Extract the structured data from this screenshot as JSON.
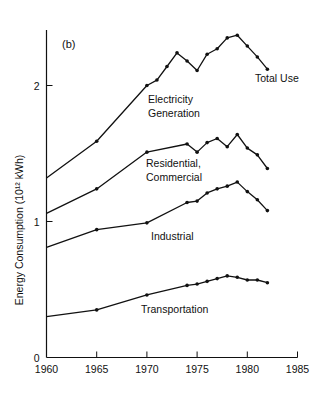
{
  "chart_data": {
    "type": "line",
    "panel_label": "(b)",
    "title": "",
    "xlabel": "",
    "ylabel": "Energy Consumption (10¹² kWh)",
    "xlim": [
      1960,
      1985
    ],
    "ylim": [
      0,
      2.4
    ],
    "x_ticks": [
      1960,
      1965,
      1970,
      1975,
      1980,
      1985
    ],
    "y_ticks": [
      0,
      1,
      2
    ],
    "grid": false,
    "legend": "inline labels",
    "series": [
      {
        "name": "Total Use",
        "label_lines": [
          "Total Use"
        ],
        "x": [
          1960,
          1965,
          1970,
          1971,
          1972,
          1973,
          1974,
          1975,
          1976,
          1977,
          1978,
          1979,
          1980,
          1981,
          1982
        ],
        "values": [
          1.32,
          1.59,
          2.0,
          2.04,
          2.14,
          2.24,
          2.18,
          2.11,
          2.23,
          2.27,
          2.35,
          2.37,
          2.29,
          2.21,
          2.12
        ]
      },
      {
        "name": "Residential, Commercial",
        "label_lines": [
          "Residential,",
          "Commercial"
        ],
        "x": [
          1960,
          1965,
          1970,
          1974,
          1975,
          1976,
          1977,
          1978,
          1979,
          1980,
          1981,
          1982
        ],
        "values": [
          1.06,
          1.24,
          1.51,
          1.57,
          1.51,
          1.58,
          1.61,
          1.55,
          1.64,
          1.54,
          1.49,
          1.39
        ]
      },
      {
        "name": "Industrial",
        "label_lines": [
          "Industrial"
        ],
        "x": [
          1960,
          1965,
          1970,
          1974,
          1975,
          1976,
          1977,
          1978,
          1979,
          1980,
          1981,
          1982
        ],
        "values": [
          0.81,
          0.94,
          0.99,
          1.14,
          1.15,
          1.21,
          1.24,
          1.26,
          1.29,
          1.22,
          1.16,
          1.08
        ]
      },
      {
        "name": "Transportation",
        "label_lines": [
          "Transportation"
        ],
        "x": [
          1960,
          1965,
          1970,
          1974,
          1975,
          1976,
          1977,
          1978,
          1979,
          1980,
          1981,
          1982
        ],
        "values": [
          0.3,
          0.35,
          0.46,
          0.53,
          0.54,
          0.56,
          0.58,
          0.6,
          0.59,
          0.57,
          0.57,
          0.55
        ]
      }
    ],
    "annotations": [
      {
        "text_lines": [
          "Electricity",
          "Generation"
        ],
        "note": "region between Total Use and Residential, Commercial"
      }
    ]
  }
}
